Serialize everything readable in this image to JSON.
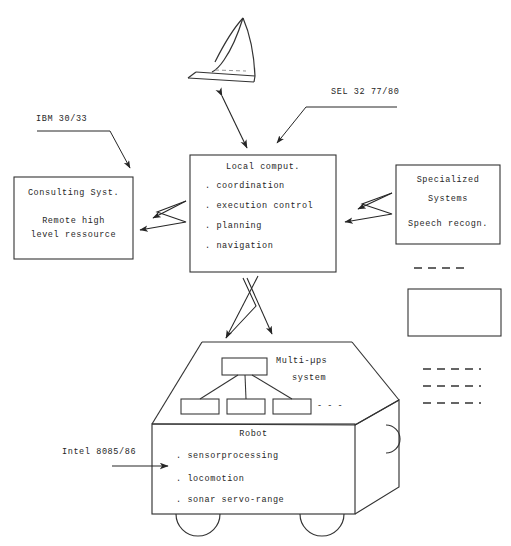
{
  "diagram": {
    "title_text": "",
    "annotations": {
      "ibm": "IBM 30/33",
      "sel": "SEL 32 77/80",
      "intel": "Intel 8085/86",
      "multiups_line1": "Multi-µps",
      "multiups_line2": "system"
    },
    "boxes": {
      "consulting": {
        "title": "Consulting Syst.",
        "line1": "Remote high",
        "line2": "level ressource"
      },
      "local_computer": {
        "title": "Local comput.",
        "items": [
          ". coordination",
          ". execution control",
          ". planning",
          ". navigation"
        ]
      },
      "specialized": {
        "line1": "Specialized",
        "line2": "Systems",
        "line3": "Speech recogn."
      },
      "empty_box": {
        "label": ""
      },
      "robot": {
        "title": "Robot",
        "items": [
          ". sensorprocessing",
          ". locomotion",
          ". sonar servo-range"
        ]
      }
    },
    "tree": {
      "continuation": "- - -"
    },
    "colors": {
      "ink": "#262626",
      "stroke": "#333333",
      "background": "#ffffff"
    }
  }
}
